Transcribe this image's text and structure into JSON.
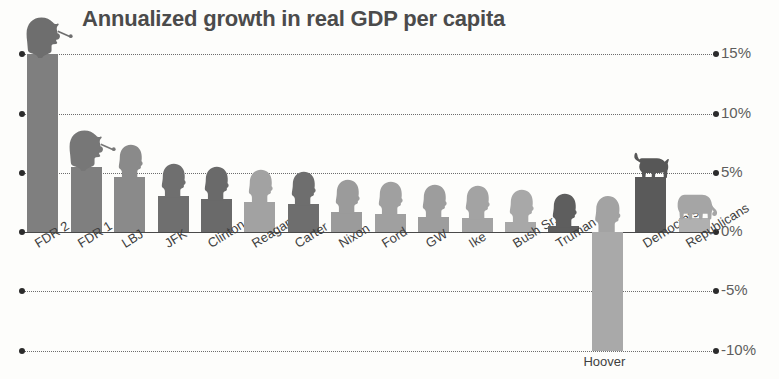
{
  "chart_data": {
    "type": "bar",
    "title": "Annualized growth in real GDP per capita",
    "xlabel": "",
    "ylabel": "",
    "ylim": [
      -11.5,
      16.5
    ],
    "grid": true,
    "legend": "none",
    "y_ticks": [
      "15%",
      "10%",
      "5%",
      "0%",
      "-5%",
      "-10%"
    ],
    "y_tick_values": [
      15,
      10,
      5,
      0,
      -5,
      -10
    ],
    "categories": [
      "FDR 2",
      "FDR 1",
      "LBJ",
      "JFK",
      "Clinton",
      "Reagan",
      "Carter",
      "Nixon",
      "Ford",
      "GW",
      "Ike",
      "Bush Sr.",
      "Truman",
      "Hoover",
      "Democrats",
      "Republicans"
    ],
    "values": [
      15.0,
      5.5,
      4.6,
      3.0,
      2.8,
      2.5,
      2.4,
      1.7,
      1.5,
      1.3,
      1.2,
      0.85,
      0.5,
      -10.0,
      4.6,
      1.2
    ],
    "bar_colors": [
      "#7f7f7f",
      "#7f7f7f",
      "#8a8a8a",
      "#6f6f6f",
      "#6a6a6a",
      "#a2a2a2",
      "#6e6e6e",
      "#9b9b9b",
      "#a0a0a0",
      "#9d9d9d",
      "#a3a3a3",
      "#a8a8a8",
      "#5e5e5e",
      "#a9a9a9",
      "#5a5a5a",
      "#b0b0b0"
    ],
    "annotations": [
      "FDR 2 bar reaches the 15% gridline — the tallest bar",
      "Hoover bar extends down to -10% — the only large negative bar",
      "Democrats aggregate bar is topped by a donkey silhouette",
      "Republicans aggregate bar is topped by an elephant silhouette",
      "Each president bar is topped by a grey head-silhouette portrait"
    ]
  },
  "axis": {
    "tick_labels": [
      "15%",
      "10%",
      "5%",
      "0%",
      "-5%",
      "-10%"
    ]
  },
  "icons": {
    "fdr_head": "fdr-silhouette-icon",
    "donkey": "democratic-donkey-icon",
    "elephant": "republican-elephant-icon",
    "head": "president-head-silhouette-icon"
  }
}
